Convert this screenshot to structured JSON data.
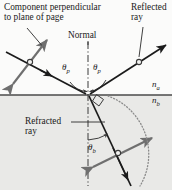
{
  "figure": {
    "title_alt": "Brewster's angle: polarization on reflection and refraction",
    "type": "optics-ray-diagram",
    "width": 172,
    "height": 190
  },
  "labels": {
    "component_perpendicular_line1": "Component perpendicular",
    "component_perpendicular_line2": "to plane of page",
    "reflected_line1": "Reflected",
    "reflected_line2": "ray",
    "normal": "Normal",
    "refracted_line1": "Refracted",
    "refracted_line2": "ray"
  },
  "symbols": {
    "theta_p_incident_base": "θ",
    "theta_p_incident_sub": "p",
    "theta_p_reflected_base": "θ",
    "theta_p_reflected_sub": "p",
    "theta_b_base": "θ",
    "theta_b_sub": "b",
    "n_a_base": "n",
    "n_a_sub": "a",
    "n_b_base": "n",
    "n_b_sub": "b"
  },
  "colors": {
    "ray": "#1b1b1b",
    "polarization_arrow": "#6f6f6f",
    "interface": "#4a4a4a",
    "medium_upper": "#fbfbfa",
    "medium_lower": "#e9e9e7",
    "dotted_arc": "#8a8a8a",
    "text": "#1a1a1a"
  },
  "geometry": {
    "origin_x": 88,
    "origin_y": 95,
    "interface_y": 95,
    "normal_x": 88,
    "incident_angle_label": "theta_p",
    "reflected_angle_label": "theta_p",
    "refracted_angle_label": "theta_b",
    "right_angle_between_reflected_and_refracted": true
  }
}
